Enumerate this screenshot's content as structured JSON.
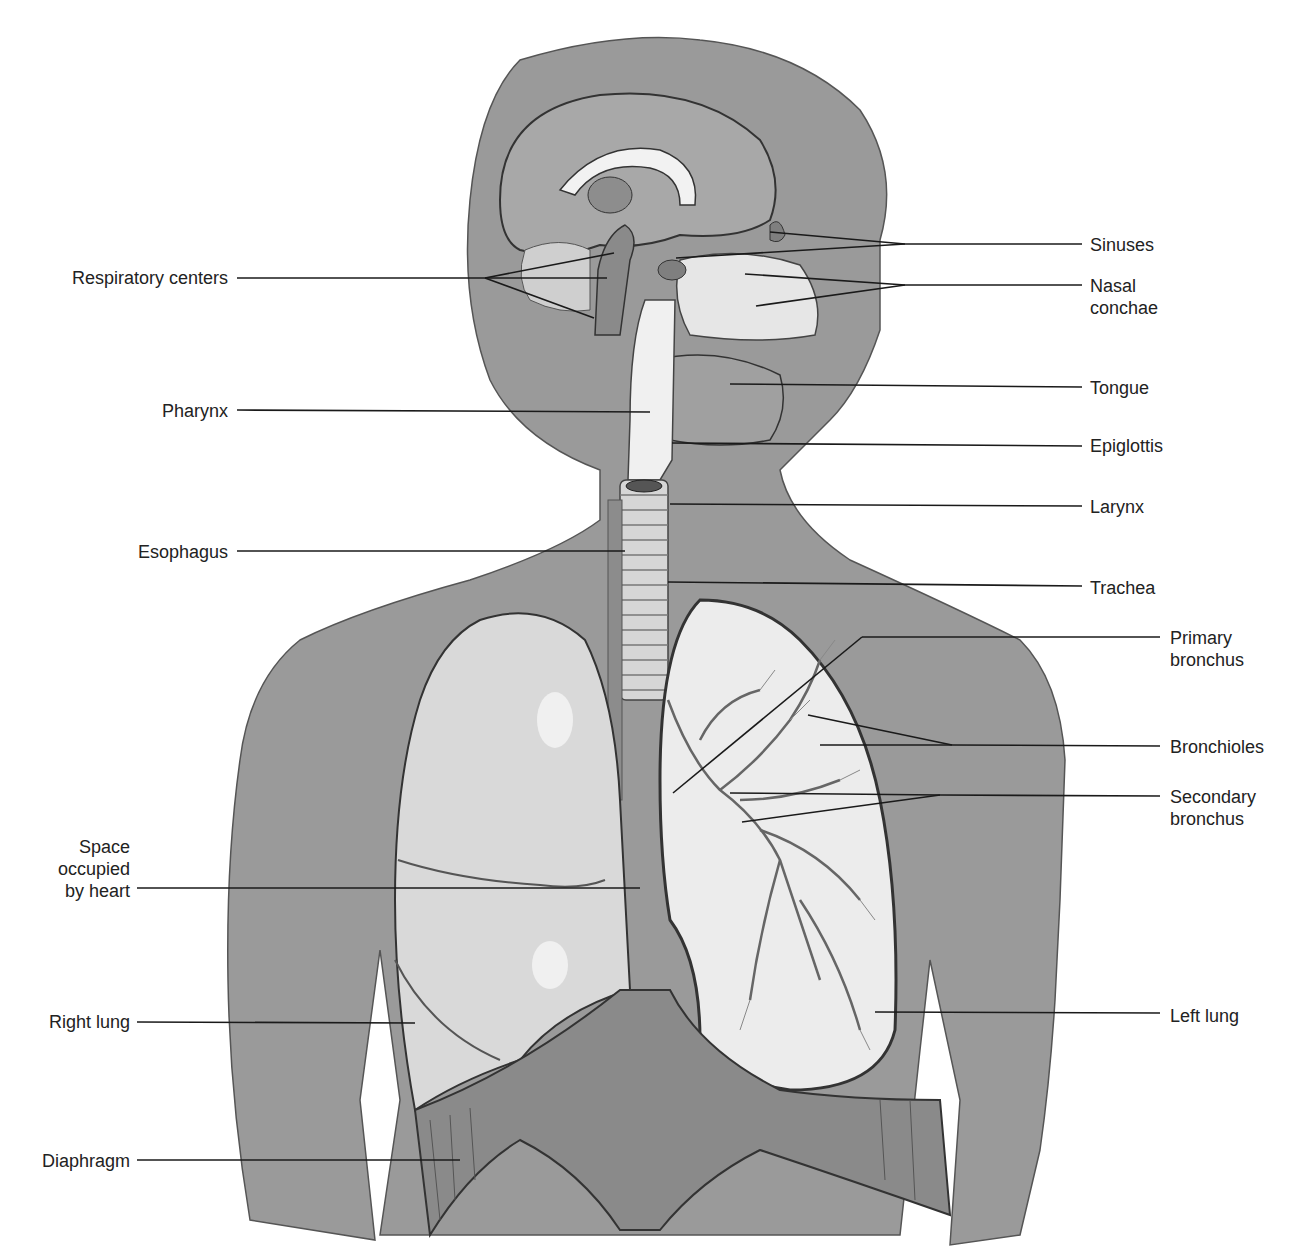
{
  "figure": {
    "colors": {
      "body": "#9a9a9a",
      "lung": "#d8d8d8",
      "tissue_light": "#eeeeee",
      "outline": "#3a3a3a",
      "leader": "#1a1a1a",
      "text": "#222222"
    }
  },
  "labels_left": [
    {
      "id": "respiratory-centers",
      "text": "Respiratory centers",
      "x": 230,
      "y": 278
    },
    {
      "id": "pharynx",
      "text": "Pharynx",
      "x": 228,
      "y": 413
    },
    {
      "id": "esophagus",
      "text": "Esophagus",
      "x": 228,
      "y": 552
    },
    {
      "id": "space-heart",
      "text": "Space\noccupied\nby heart",
      "x": 130,
      "y": 870
    },
    {
      "id": "right-lung",
      "text": "Right lung",
      "x": 130,
      "y": 1022
    },
    {
      "id": "diaphragm",
      "text": "Diaphragm",
      "x": 130,
      "y": 1162
    }
  ],
  "labels_right": [
    {
      "id": "sinuses",
      "text": "Sinuses",
      "x": 1090,
      "y": 245
    },
    {
      "id": "nasal-conchae",
      "text": "Nasal\nconchae",
      "x": 1090,
      "y": 296
    },
    {
      "id": "tongue",
      "text": "Tongue",
      "x": 1090,
      "y": 388
    },
    {
      "id": "epiglottis",
      "text": "Epiglottis",
      "x": 1090,
      "y": 447
    },
    {
      "id": "larynx",
      "text": "Larynx",
      "x": 1090,
      "y": 508
    },
    {
      "id": "trachea",
      "text": "Trachea",
      "x": 1090,
      "y": 588
    },
    {
      "id": "primary-bronchus",
      "text": "Primary\nbronchus",
      "x": 1170,
      "y": 652
    },
    {
      "id": "bronchioles",
      "text": "Bronchioles",
      "x": 1170,
      "y": 748
    },
    {
      "id": "secondary-bronchus",
      "text": "Secondary\nbronchus",
      "x": 1170,
      "y": 811
    },
    {
      "id": "left-lung",
      "text": "Left lung",
      "x": 1170,
      "y": 1017
    }
  ]
}
